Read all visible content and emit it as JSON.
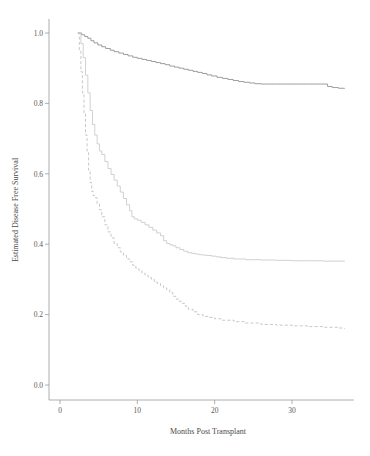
{
  "chart_data": {
    "type": "line",
    "title": "",
    "xlabel": "Months Post Transplant",
    "ylabel": "Estimated Disease Free Survival",
    "xlim": [
      -0.8,
      38
    ],
    "ylim": [
      0.0,
      1.04
    ],
    "xticks": [
      0,
      10,
      20,
      30
    ],
    "xticklabels": [
      "0",
      "10",
      "20",
      "30"
    ],
    "yticks": [
      0.0,
      0.2,
      0.4,
      0.6,
      0.8,
      1.0
    ],
    "yticklabels": [
      "0.0",
      "0.2",
      "0.4",
      "0.6",
      "0.8",
      "1.0"
    ],
    "grid": false,
    "legend": "none",
    "step_style": "post",
    "series": [
      {
        "name": "curve-top",
        "style": "solid",
        "color": "#8d8d8d",
        "x": [
          2.3,
          2.8,
          3.2,
          3.6,
          4.0,
          4.4,
          4.9,
          5.4,
          5.9,
          6.5,
          7.0,
          7.6,
          8.2,
          8.8,
          9.4,
          10.0,
          10.6,
          11.2,
          11.8,
          12.4,
          13.0,
          13.6,
          14.2,
          14.8,
          15.4,
          16.0,
          16.6,
          17.2,
          17.8,
          18.4,
          19.0,
          19.6,
          20.3,
          21.0,
          21.7,
          22.4,
          23.1,
          23.8,
          24.5,
          25.2,
          26.0,
          27.0,
          28.0,
          29.0,
          30.0,
          31.0,
          32.0,
          33.0,
          34.0,
          34.6,
          35.2,
          36.0,
          36.8
        ],
        "y": [
          1.0,
          0.995,
          0.99,
          0.985,
          0.978,
          0.972,
          0.966,
          0.961,
          0.956,
          0.951,
          0.947,
          0.943,
          0.939,
          0.935,
          0.931,
          0.928,
          0.925,
          0.922,
          0.919,
          0.916,
          0.913,
          0.91,
          0.906,
          0.903,
          0.9,
          0.897,
          0.894,
          0.891,
          0.888,
          0.885,
          0.881,
          0.878,
          0.874,
          0.871,
          0.868,
          0.865,
          0.862,
          0.86,
          0.858,
          0.856,
          0.855,
          0.855,
          0.855,
          0.855,
          0.855,
          0.855,
          0.855,
          0.855,
          0.855,
          0.848,
          0.845,
          0.843,
          0.842
        ]
      },
      {
        "name": "curve-mid",
        "style": "solid",
        "color": "#c9c9c9",
        "x": [
          2.3,
          2.7,
          3.0,
          3.3,
          3.6,
          3.9,
          4.2,
          4.5,
          4.8,
          5.1,
          5.4,
          5.8,
          6.2,
          6.6,
          7.0,
          7.4,
          7.8,
          8.2,
          8.6,
          9.0,
          9.3,
          9.6,
          10.0,
          10.5,
          11.0,
          11.5,
          12.0,
          12.5,
          13.0,
          13.4,
          13.8,
          14.2,
          14.6,
          15.0,
          15.5,
          16.0,
          16.5,
          17.0,
          17.5,
          18.0,
          18.5,
          19.0,
          19.6,
          20.2,
          20.8,
          21.5,
          22.5,
          24.0,
          26.0,
          28.0,
          30.0,
          32.0,
          34.0,
          36.0,
          36.8
        ],
        "y": [
          1.0,
          0.97,
          0.93,
          0.88,
          0.83,
          0.78,
          0.74,
          0.71,
          0.685,
          0.665,
          0.655,
          0.635,
          0.615,
          0.598,
          0.582,
          0.565,
          0.548,
          0.53,
          0.512,
          0.495,
          0.478,
          0.472,
          0.468,
          0.462,
          0.455,
          0.448,
          0.44,
          0.432,
          0.424,
          0.41,
          0.402,
          0.398,
          0.395,
          0.39,
          0.385,
          0.38,
          0.376,
          0.374,
          0.372,
          0.37,
          0.369,
          0.368,
          0.366,
          0.364,
          0.362,
          0.36,
          0.358,
          0.356,
          0.355,
          0.354,
          0.353,
          0.353,
          0.352,
          0.352,
          0.351
        ]
      },
      {
        "name": "curve-bottom",
        "style": "dashed",
        "color": "#bdbdbd",
        "x": [
          2.3,
          2.5,
          2.7,
          2.9,
          3.1,
          3.3,
          3.5,
          3.7,
          3.9,
          4.1,
          4.3,
          4.5,
          4.8,
          5.1,
          5.4,
          5.8,
          6.2,
          6.6,
          7.0,
          7.4,
          7.8,
          8.2,
          8.6,
          9.0,
          9.4,
          9.8,
          10.2,
          10.6,
          11.0,
          11.4,
          11.8,
          12.2,
          12.6,
          13.0,
          13.4,
          13.8,
          14.2,
          14.6,
          15.0,
          15.4,
          15.8,
          16.2,
          16.6,
          17.2,
          17.8,
          18.5,
          19.2,
          20.0,
          21.0,
          22.5,
          24.0,
          26.0,
          28.0,
          30.0,
          32.0,
          34.0,
          36.0,
          36.8
        ],
        "y": [
          1.0,
          0.95,
          0.89,
          0.83,
          0.77,
          0.71,
          0.66,
          0.61,
          0.575,
          0.55,
          0.538,
          0.532,
          0.515,
          0.498,
          0.478,
          0.455,
          0.435,
          0.418,
          0.402,
          0.39,
          0.378,
          0.368,
          0.358,
          0.35,
          0.34,
          0.332,
          0.325,
          0.318,
          0.312,
          0.306,
          0.3,
          0.292,
          0.288,
          0.282,
          0.276,
          0.27,
          0.262,
          0.252,
          0.244,
          0.238,
          0.232,
          0.224,
          0.215,
          0.208,
          0.2,
          0.195,
          0.192,
          0.188,
          0.184,
          0.18,
          0.176,
          0.172,
          0.17,
          0.168,
          0.166,
          0.164,
          0.162,
          0.16
        ]
      }
    ]
  }
}
